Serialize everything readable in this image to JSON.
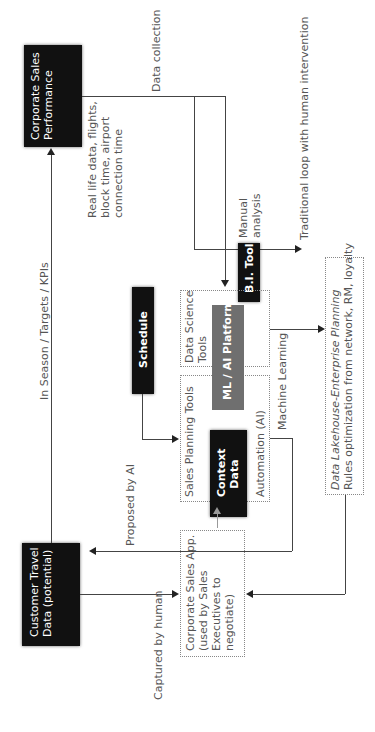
{
  "diagram": {
    "orientation": "rotated 90° counter-clockwise",
    "nodes": {
      "corporate_sales_performance": {
        "line1": "Corporate Sales",
        "line2": "Performance"
      },
      "customer_travel_data": {
        "line1": "Customer Travel",
        "line2": "Data (potential)"
      },
      "schedule": {
        "label": "Schedule"
      },
      "bi_tool": {
        "label": "B.I. Tool"
      },
      "ml_ai_platform": {
        "label": "ML / AI Platform"
      },
      "context_data": {
        "line1": "Context",
        "line2": "Data"
      },
      "data_science_tools": {
        "line1": "Data Science",
        "line2": "Tools"
      },
      "sales_planning_tools": {
        "label": "Sales Planning Tools",
        "sub": "Automation (AI)"
      },
      "data_lakehouse": {
        "title": "Data Lakehouse-Enterprise Planning",
        "sub": "Rules optimization from network, RM, loyalty"
      },
      "corporate_sales_app": {
        "line1": "Corporate Sales App.",
        "line2": "(used by Sales",
        "line3": "Executives to",
        "line4": "negotiate)"
      }
    },
    "edge_labels": {
      "data_collection": "Data collection",
      "traditional_loop": "Traditional loop with human intervention",
      "real_life_1": "Real life data, flights,",
      "real_life_2": "block time, airport",
      "real_life_3": "connection time",
      "manual_1": "Manual",
      "manual_2": "analysis",
      "in_season": "In Season / Targets / KPIs",
      "machine_learning": "Machine Learning",
      "proposed_by_ai": "Proposed by AI",
      "captured_by_human": "Captured by human"
    },
    "colors": {
      "black_box": "#111111",
      "grey_box": "#6f6f6f",
      "line": "#444444",
      "text": "#555555"
    }
  }
}
